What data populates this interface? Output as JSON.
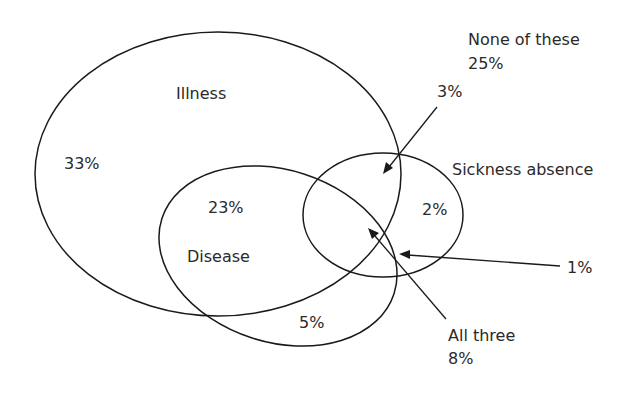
{
  "diagram": {
    "type": "venn",
    "sets": [
      {
        "name": "Illness",
        "label": "Illness",
        "only_pct": "33%"
      },
      {
        "name": "Disease",
        "label": "Disease",
        "only_pct": "5%"
      },
      {
        "name": "Sickness absence",
        "label": "Sickness absence",
        "only_pct": "2%"
      }
    ],
    "regions": {
      "illness_only": "33%",
      "illness_and_disease": "23%",
      "disease_only": "5%",
      "sickness_only": "2%",
      "illness_and_sickness": "3%",
      "disease_and_sickness": "1%",
      "all_three": "8%",
      "none": "25%"
    },
    "labels": {
      "illness": "Illness",
      "disease": "Disease",
      "sickness": "Sickness absence",
      "none_title": "None of these",
      "all_three_title": "All three"
    }
  }
}
